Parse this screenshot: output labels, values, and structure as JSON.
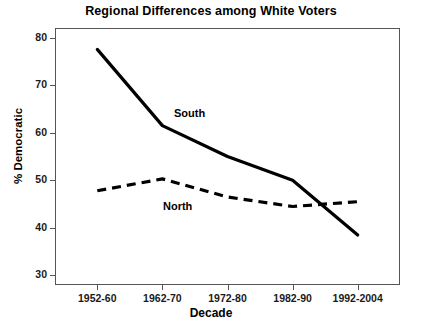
{
  "chart_data": {
    "type": "line",
    "title": "Regional Differences among White Voters",
    "xlabel": "Decade",
    "ylabel": "% Democratic",
    "categories": [
      "1952-60",
      "1962-70",
      "1972-80",
      "1982-90",
      "1992-2004"
    ],
    "ylim": [
      28,
      82
    ],
    "yticks": [
      30,
      40,
      50,
      60,
      70,
      80
    ],
    "ytick_labels": [
      "30",
      "40",
      "50",
      "60",
      "70",
      "80"
    ],
    "grid": false,
    "legend": "inline-annotations",
    "series": [
      {
        "name": "South",
        "style": "solid",
        "color": "#000000",
        "values": [
          77.5,
          61.5,
          55.0,
          50.0,
          38.5
        ],
        "label_text": "South"
      },
      {
        "name": "North",
        "style": "dashed",
        "color": "#000000",
        "values": [
          47.8,
          50.3,
          46.5,
          44.5,
          45.5
        ],
        "label_text": "North"
      }
    ],
    "annotations": [
      "South",
      "North"
    ]
  }
}
